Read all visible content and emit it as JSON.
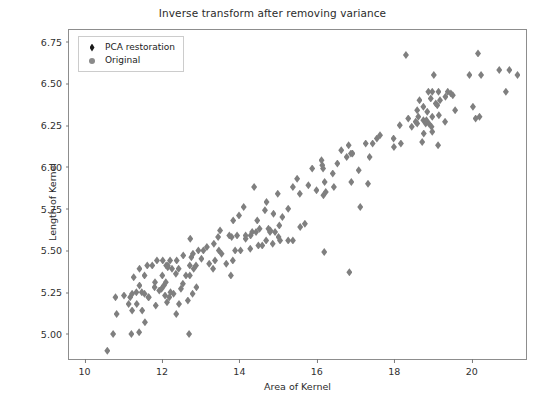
{
  "chart_data": {
    "type": "scatter",
    "title": "Inverse transform after removing variance",
    "xlabel": "Area of Kernel",
    "ylabel": "Length of Kernel",
    "xlim": [
      9.6,
      21.4
    ],
    "ylim": [
      4.85,
      6.82
    ],
    "xticks": [
      10,
      12,
      14,
      16,
      18,
      20
    ],
    "yticks": [
      5.0,
      5.25,
      5.5,
      5.75,
      6.0,
      6.25,
      6.5,
      6.75
    ],
    "ytick_labels": [
      "5.00",
      "5.25",
      "5.50",
      "5.75",
      "6.00",
      "6.25",
      "6.50",
      "6.75"
    ],
    "xtick_labels": [
      "10",
      "12",
      "14",
      "16",
      "18",
      "20"
    ],
    "grid": false,
    "legend_position": "upper left",
    "series": [
      {
        "name": "PCA restoration",
        "marker": "diamond",
        "color": "#1a1a1a",
        "points": []
      },
      {
        "name": "Original",
        "marker": "circle",
        "color": "#8a8a8a",
        "points": [
          [
            10.59,
            4.9
          ],
          [
            10.74,
            5.0
          ],
          [
            10.8,
            5.22
          ],
          [
            10.83,
            5.12
          ],
          [
            11.02,
            5.23
          ],
          [
            11.14,
            5.18
          ],
          [
            11.18,
            5.22
          ],
          [
            11.21,
            5.0
          ],
          [
            11.23,
            5.14
          ],
          [
            11.23,
            5.24
          ],
          [
            11.27,
            5.34
          ],
          [
            11.34,
            5.25
          ],
          [
            11.35,
            5.18
          ],
          [
            11.41,
            5.01
          ],
          [
            11.42,
            5.29
          ],
          [
            11.42,
            5.39
          ],
          [
            11.48,
            5.25
          ],
          [
            11.49,
            5.14
          ],
          [
            11.55,
            5.35
          ],
          [
            11.55,
            5.24
          ],
          [
            11.56,
            5.07
          ],
          [
            11.62,
            5.41
          ],
          [
            11.65,
            5.22
          ],
          [
            11.66,
            5.22
          ],
          [
            11.75,
            5.41
          ],
          [
            11.81,
            5.28
          ],
          [
            11.82,
            5.31
          ],
          [
            11.84,
            5.17
          ],
          [
            11.87,
            5.44
          ],
          [
            11.93,
            5.26
          ],
          [
            11.99,
            5.27
          ],
          [
            12.01,
            5.35
          ],
          [
            12.02,
            5.44
          ],
          [
            12.05,
            5.29
          ],
          [
            12.08,
            5.23
          ],
          [
            12.1,
            5.31
          ],
          [
            12.11,
            5.41
          ],
          [
            12.13,
            5.19
          ],
          [
            12.15,
            5.41
          ],
          [
            12.15,
            5.4
          ],
          [
            12.19,
            5.22
          ],
          [
            12.21,
            5.44
          ],
          [
            12.22,
            5.25
          ],
          [
            12.26,
            5.39
          ],
          [
            12.3,
            5.24
          ],
          [
            12.36,
            5.36
          ],
          [
            12.37,
            5.12
          ],
          [
            12.38,
            5.44
          ],
          [
            12.43,
            5.39
          ],
          [
            12.44,
            5.18
          ],
          [
            12.49,
            5.27
          ],
          [
            12.54,
            5.3
          ],
          [
            12.55,
            5.47
          ],
          [
            12.62,
            5.35
          ],
          [
            12.67,
            5.2
          ],
          [
            12.7,
            5.0
          ],
          [
            12.72,
            5.35
          ],
          [
            12.72,
            5.41
          ],
          [
            12.73,
            5.57
          ],
          [
            12.76,
            5.46
          ],
          [
            12.79,
            5.24
          ],
          [
            12.8,
            5.48
          ],
          [
            12.82,
            5.39
          ],
          [
            12.88,
            5.41
          ],
          [
            12.89,
            5.28
          ],
          [
            12.94,
            5.5
          ],
          [
            13.02,
            5.45
          ],
          [
            13.07,
            5.5
          ],
          [
            13.16,
            5.52
          ],
          [
            13.22,
            5.42
          ],
          [
            13.32,
            5.39
          ],
          [
            13.34,
            5.54
          ],
          [
            13.37,
            5.44
          ],
          [
            13.45,
            5.58
          ],
          [
            13.47,
            5.5
          ],
          [
            13.5,
            5.62
          ],
          [
            13.54,
            5.48
          ],
          [
            13.66,
            5.42
          ],
          [
            13.74,
            5.59
          ],
          [
            13.78,
            5.35
          ],
          [
            13.8,
            5.58
          ],
          [
            13.83,
            5.44
          ],
          [
            13.84,
            5.68
          ],
          [
            13.89,
            5.5
          ],
          [
            13.94,
            5.59
          ],
          [
            13.99,
            5.71
          ],
          [
            14.03,
            5.5
          ],
          [
            14.11,
            5.76
          ],
          [
            14.16,
            5.57
          ],
          [
            14.16,
            5.59
          ],
          [
            14.28,
            5.51
          ],
          [
            14.29,
            5.59
          ],
          [
            14.33,
            5.61
          ],
          [
            14.38,
            5.88
          ],
          [
            14.43,
            5.61
          ],
          [
            14.46,
            5.68
          ],
          [
            14.49,
            5.53
          ],
          [
            14.52,
            5.63
          ],
          [
            14.59,
            5.53
          ],
          [
            14.66,
            5.74
          ],
          [
            14.69,
            5.56
          ],
          [
            14.7,
            5.79
          ],
          [
            14.75,
            5.63
          ],
          [
            14.79,
            5.61
          ],
          [
            14.8,
            5.62
          ],
          [
            14.86,
            5.54
          ],
          [
            14.88,
            5.72
          ],
          [
            14.92,
            5.61
          ],
          [
            14.99,
            5.84
          ],
          [
            15.01,
            5.58
          ],
          [
            15.03,
            5.65
          ],
          [
            15.05,
            5.56
          ],
          [
            15.11,
            5.7
          ],
          [
            15.26,
            5.75
          ],
          [
            15.26,
            5.56
          ],
          [
            15.38,
            5.88
          ],
          [
            15.38,
            5.56
          ],
          [
            15.49,
            5.93
          ],
          [
            15.56,
            5.84
          ],
          [
            15.57,
            5.64
          ],
          [
            15.69,
            5.66
          ],
          [
            15.78,
            5.89
          ],
          [
            15.88,
            5.99
          ],
          [
            15.99,
            5.86
          ],
          [
            16.12,
            6.04
          ],
          [
            16.14,
            6.01
          ],
          [
            16.16,
            5.99
          ],
          [
            16.17,
            5.83
          ],
          [
            16.19,
            5.49
          ],
          [
            16.2,
            5.91
          ],
          [
            16.23,
            5.85
          ],
          [
            16.41,
            5.96
          ],
          [
            16.44,
            5.88
          ],
          [
            16.53,
            6.02
          ],
          [
            16.63,
            6.1
          ],
          [
            16.77,
            6.06
          ],
          [
            16.82,
            6.13
          ],
          [
            16.84,
            5.37
          ],
          [
            16.88,
            6.08
          ],
          [
            16.89,
            5.91
          ],
          [
            16.92,
            6.08
          ],
          [
            17.08,
            5.98
          ],
          [
            17.12,
            5.76
          ],
          [
            17.26,
            6.14
          ],
          [
            17.32,
            5.9
          ],
          [
            17.36,
            6.06
          ],
          [
            17.44,
            6.14
          ],
          [
            17.55,
            6.17
          ],
          [
            17.63,
            6.19
          ],
          [
            17.98,
            6.17
          ],
          [
            17.99,
            6.12
          ],
          [
            18.14,
            6.25
          ],
          [
            18.17,
            6.14
          ],
          [
            18.3,
            6.67
          ],
          [
            18.36,
            6.29
          ],
          [
            18.45,
            6.24
          ],
          [
            18.55,
            6.27
          ],
          [
            18.59,
            6.26
          ],
          [
            18.59,
            6.34
          ],
          [
            18.62,
            6.3
          ],
          [
            18.65,
            6.4
          ],
          [
            18.72,
            6.15
          ],
          [
            18.75,
            6.28
          ],
          [
            18.75,
            6.36
          ],
          [
            18.76,
            6.2
          ],
          [
            18.81,
            6.26
          ],
          [
            18.83,
            6.28
          ],
          [
            18.85,
            6.33
          ],
          [
            18.88,
            6.45
          ],
          [
            18.89,
            6.26
          ],
          [
            18.94,
            6.41
          ],
          [
            18.96,
            6.24
          ],
          [
            18.98,
            6.3
          ],
          [
            18.98,
            6.21
          ],
          [
            18.98,
            6.45
          ],
          [
            19.02,
            6.55
          ],
          [
            19.07,
            6.38
          ],
          [
            19.11,
            6.37
          ],
          [
            19.13,
            6.13
          ],
          [
            19.14,
            6.45
          ],
          [
            19.15,
            6.31
          ],
          [
            19.18,
            6.4
          ],
          [
            19.31,
            6.27
          ],
          [
            19.32,
            6.42
          ],
          [
            19.38,
            6.45
          ],
          [
            19.46,
            6.44
          ],
          [
            19.51,
            6.43
          ],
          [
            19.57,
            6.34
          ],
          [
            19.94,
            6.55
          ],
          [
            20.03,
            6.36
          ],
          [
            20.1,
            6.29
          ],
          [
            20.16,
            6.68
          ],
          [
            20.2,
            6.3
          ],
          [
            20.24,
            6.55
          ],
          [
            20.71,
            6.58
          ],
          [
            20.88,
            6.45
          ],
          [
            20.97,
            6.58
          ],
          [
            21.18,
            6.55
          ]
        ]
      }
    ]
  },
  "legend": {
    "entries": [
      {
        "label": "PCA restoration",
        "marker": "diamond-icon"
      },
      {
        "label": "Original",
        "marker": "circle-icon"
      }
    ]
  },
  "colors": {
    "marker_gray": "#7f7f7f",
    "marker_dark": "#1a1a1a",
    "axis": "#8d8d8d",
    "text": "#2b2b2b"
  }
}
